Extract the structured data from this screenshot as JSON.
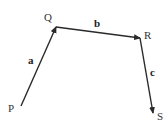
{
  "diagram": {
    "type": "vector-path",
    "points": [
      {
        "id": "P",
        "label": "P",
        "x": 21,
        "y": 106,
        "lx": 8,
        "ly": 112
      },
      {
        "id": "Q",
        "label": "Q",
        "x": 56,
        "y": 27,
        "lx": 44,
        "ly": 21
      },
      {
        "id": "R",
        "label": "R",
        "x": 140,
        "y": 38,
        "lx": 144,
        "ly": 39
      },
      {
        "id": "S",
        "label": "S",
        "x": 153,
        "y": 113,
        "lx": 157,
        "ly": 120
      }
    ],
    "vectors": [
      {
        "id": "a",
        "label": "a",
        "from": "P",
        "to": "Q",
        "lx": 28,
        "ly": 64
      },
      {
        "id": "b",
        "label": "b",
        "from": "Q",
        "to": "R",
        "lx": 94,
        "ly": 27
      },
      {
        "id": "c",
        "label": "c",
        "from": "R",
        "to": "S",
        "lx": 150,
        "ly": 76
      }
    ],
    "stroke_color": "#2a2a2a"
  }
}
